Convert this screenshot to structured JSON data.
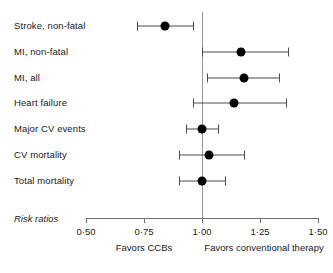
{
  "chart_data": {
    "type": "scatter",
    "subtype": "forest-plot",
    "title": "",
    "xlabel": "Risk ratios",
    "ylabel": "",
    "xlim": [
      0.5,
      1.5
    ],
    "grid": false,
    "legend": null,
    "reference_line": 1.0,
    "tick_values": [
      0.5,
      0.75,
      1.0,
      1.25,
      1.5
    ],
    "tick_labels": [
      "0·50",
      "0·75",
      "1·00",
      "1·25",
      "1·50"
    ],
    "categories": [
      "Stroke, non-fatal",
      "MI, non-fatal",
      "MI, all",
      "Heart failure",
      "Major CV events",
      "CV mortality",
      "Total mortality"
    ],
    "values": [
      0.84,
      1.17,
      1.18,
      1.14,
      1.0,
      1.03,
      1.0
    ],
    "ci_low": [
      0.72,
      1.0,
      1.02,
      0.96,
      0.93,
      0.9,
      0.9
    ],
    "ci_high": [
      0.96,
      1.37,
      1.33,
      1.36,
      1.07,
      1.18,
      1.1
    ],
    "rows": [
      {
        "label": "Stroke, non-fatal",
        "value": 0.84,
        "low": 0.72,
        "high": 0.96
      },
      {
        "label": "MI, non-fatal",
        "value": 1.17,
        "low": 1.0,
        "high": 1.37
      },
      {
        "label": "MI, all",
        "value": 1.18,
        "low": 1.02,
        "high": 1.33
      },
      {
        "label": "Heart failure",
        "value": 1.14,
        "low": 0.96,
        "high": 1.36
      },
      {
        "label": "Major CV events",
        "value": 1.0,
        "low": 0.93,
        "high": 1.07
      },
      {
        "label": "CV mortality",
        "value": 1.03,
        "low": 0.9,
        "high": 1.18
      },
      {
        "label": "Total mortality",
        "value": 1.0,
        "low": 0.9,
        "high": 1.1
      }
    ],
    "annotations": {
      "left_caption": "Favors CCBs",
      "right_caption": "Favors conventional therapy",
      "axis_title": "Risk ratios"
    },
    "colors": {
      "point": "#000000",
      "ci": "#4a4a4a",
      "reference_line": "#9a9a9a",
      "axis": "#6f6f6f",
      "text": "#1a1a1a",
      "background": "#ffffff"
    }
  }
}
